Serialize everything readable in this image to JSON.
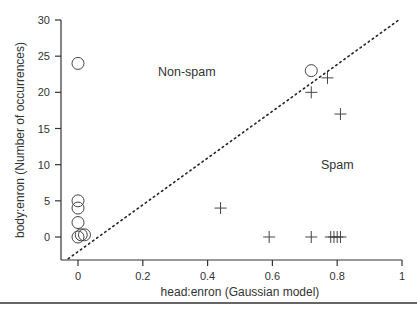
{
  "chart_data": {
    "type": "scatter",
    "title": "",
    "xlabel": "head:enron (Gaussian model)",
    "ylabel": "body:enron (Number of occurrences)",
    "xlim": [
      -0.05,
      1.0
    ],
    "ylim": [
      -3,
      30
    ],
    "xticks": [
      0,
      0.2,
      0.4,
      0.6,
      0.8,
      1
    ],
    "xtick_labels": [
      "0",
      "0.2",
      "0.4",
      "0.6",
      "0.8",
      "1"
    ],
    "yticks": [
      0,
      5,
      10,
      15,
      20,
      25,
      30
    ],
    "ytick_labels": [
      "0",
      "5",
      "10",
      "15",
      "20",
      "25",
      "30"
    ],
    "grid": false,
    "legend": null,
    "annotations": [
      {
        "text": "Non-spam",
        "x": 0.35,
        "y": 22.6
      },
      {
        "text": "Spam",
        "x": 0.87,
        "y": 7.7
      }
    ],
    "decision_boundary": {
      "style": "dotted",
      "x": [
        -0.03,
        0.99
      ],
      "y": [
        -3,
        30
      ]
    },
    "series": [
      {
        "name": "Non-spam",
        "marker": "circle",
        "points": [
          {
            "x": 0.0,
            "y": 24
          },
          {
            "x": 0.0,
            "y": 5
          },
          {
            "x": 0.0,
            "y": 4
          },
          {
            "x": 0.0,
            "y": 2
          },
          {
            "x": 0.0,
            "y": 0
          },
          {
            "x": 0.01,
            "y": 0.3
          },
          {
            "x": 0.02,
            "y": 0.3
          },
          {
            "x": 0.72,
            "y": 23
          }
        ]
      },
      {
        "name": "Spam",
        "marker": "plus",
        "points": [
          {
            "x": 0.44,
            "y": 4
          },
          {
            "x": 0.59,
            "y": 0
          },
          {
            "x": 0.72,
            "y": 0
          },
          {
            "x": 0.72,
            "y": 20
          },
          {
            "x": 0.77,
            "y": 22
          },
          {
            "x": 0.78,
            "y": 0
          },
          {
            "x": 0.79,
            "y": 0
          },
          {
            "x": 0.8,
            "y": 0
          },
          {
            "x": 0.81,
            "y": 0
          },
          {
            "x": 0.81,
            "y": 17
          }
        ]
      }
    ]
  }
}
